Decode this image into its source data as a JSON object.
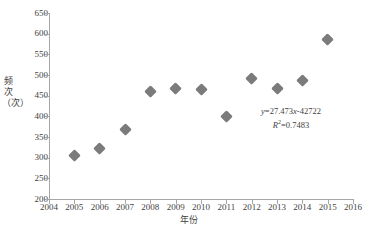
{
  "chart_data": {
    "type": "scatter",
    "title": "",
    "subtitle": "",
    "xlabel": "年份",
    "ylabel": "频次（次）",
    "xlim": [
      2004,
      2016
    ],
    "ylim": [
      200,
      650
    ],
    "xticks": [
      2004,
      2005,
      2006,
      2007,
      2008,
      2009,
      2010,
      2011,
      2012,
      2013,
      2014,
      2015,
      2016
    ],
    "yticks": [
      200,
      250,
      300,
      350,
      400,
      450,
      500,
      550,
      600,
      650
    ],
    "grid": false,
    "legend": "none",
    "x": [
      2005,
      2006,
      2007,
      2008,
      2009,
      2010,
      2011,
      2012,
      2013,
      2014,
      2015
    ],
    "values": [
      305,
      321,
      368,
      461,
      468,
      464,
      399,
      491,
      468,
      487,
      585
    ],
    "series": [
      {
        "name": "频次",
        "marker": "diamond",
        "color": "#7b7b7b",
        "values": [
          305,
          321,
          368,
          461,
          468,
          464,
          399,
          491,
          468,
          487,
          585
        ]
      }
    ],
    "trendline": {
      "type": "linear-dashed",
      "color": "#8c8c8c",
      "slope": 27.473,
      "intercept": -42722,
      "x_start": 2004.8,
      "x_end": 2015.5
    },
    "annotations": {
      "equation": "y=27.473x-42722",
      "equation_y_var": "y",
      "equation_body": "=27.473",
      "equation_x_var": "x",
      "equation_tail": "-42722",
      "r_squared_label": "R",
      "r_squared_sup": "2",
      "r_squared_value": "=0.7483"
    }
  },
  "axis": {
    "x_title": "年份",
    "y_title": "频次（次）"
  },
  "colors": {
    "marker": "#7b7b7b",
    "trendline": "#8c8c8c",
    "axis": "#a6a6a6",
    "text": "#3f3f3f"
  }
}
